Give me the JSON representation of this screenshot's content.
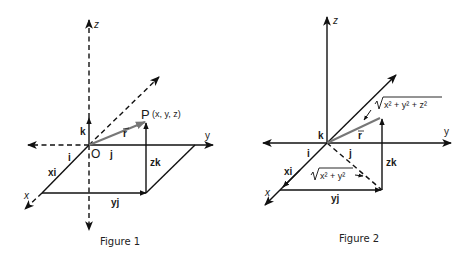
{
  "figure1": {
    "caption": "Figure 1",
    "labels": {
      "z_axis": "z",
      "y_axis": "y",
      "x_axis": "x",
      "origin": "O",
      "point": "P",
      "point_coords": "(x, y, z)",
      "i": "i",
      "j": "j",
      "k": "k",
      "r": "r",
      "xi": "xi",
      "yj": "yj",
      "zk": "zk"
    }
  },
  "figure2": {
    "caption": "Figure 2",
    "labels": {
      "z_axis": "z",
      "y_axis": "y",
      "x_axis": "x",
      "i": "i",
      "j": "j",
      "k": "k",
      "r": "r",
      "xi": "xi",
      "yj": "yj",
      "zk": "zk",
      "magnitude_3d": "x² + y² + z²",
      "magnitude_2d": "x² + y²"
    }
  },
  "colors": {
    "line": "#111111",
    "vector_r": "#777777",
    "background": "#ffffff"
  }
}
